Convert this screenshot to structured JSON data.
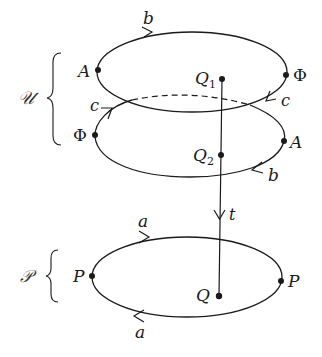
{
  "diagram": {
    "groups": {
      "U": {
        "label": "𝒰"
      },
      "P": {
        "label": "𝒫"
      }
    },
    "top_loop": {
      "edge_label_top": "b",
      "vertex_left": "A",
      "vertex_right": "Φ",
      "edge_label_right": "c"
    },
    "middle_loop": {
      "edge_label_left": "c",
      "vertex_left": "Φ",
      "vertex_right": "A",
      "edge_label_bottom": "b"
    },
    "bottom_loop": {
      "edge_label_top": "a",
      "edge_label_bottom": "a",
      "vertex_left": "P",
      "vertex_right": "P"
    },
    "points": {
      "q1": {
        "main": "Q",
        "sub": "1"
      },
      "q2": {
        "main": "Q",
        "sub": "2"
      },
      "q": {
        "main": "Q"
      }
    },
    "vertical_edge": {
      "label": "t"
    },
    "colors": {
      "stroke": "#1a1a1a",
      "background": "#ffffff"
    }
  }
}
